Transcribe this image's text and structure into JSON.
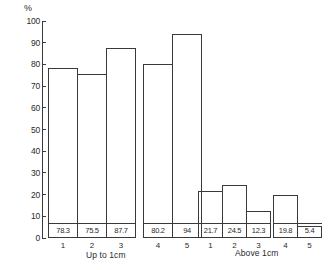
{
  "chart_data": {
    "type": "bar",
    "title": "",
    "subtitle": "",
    "xlabel": "",
    "ylabel": "%",
    "ylim": [
      0,
      100
    ],
    "ytick_step": 10,
    "ytick_labels": [
      "0",
      "10",
      "20",
      "30",
      "40",
      "50",
      "60",
      "70",
      "80",
      "90",
      "100"
    ],
    "grid": false,
    "legend": null,
    "bar_style": "outlined",
    "value_labels_inside_bars": true,
    "groups": [
      {
        "caption": "Up to 1cm",
        "clusters": [
          {
            "categories": [
              "1",
              "2",
              "3"
            ],
            "values": [
              78.3,
              75.5,
              87.7
            ],
            "value_labels": [
              "78.3",
              "75.5",
              "87.7"
            ]
          },
          {
            "categories": [
              "4",
              "5"
            ],
            "values": [
              80.2,
              94
            ],
            "value_labels": [
              "80.2",
              "94"
            ]
          }
        ]
      },
      {
        "caption": "Above 1cm",
        "clusters": [
          {
            "categories": [
              "1",
              "2",
              "3"
            ],
            "values": [
              21.7,
              24.5,
              12.3
            ],
            "value_labels": [
              "21.7",
              "24.5",
              "12.3"
            ]
          },
          {
            "categories": [
              "4",
              "5"
            ],
            "values": [
              19.8,
              5.4
            ],
            "value_labels": [
              "19.8",
              "5.4"
            ]
          }
        ]
      }
    ],
    "colors": {
      "ink": "#3a3a3a",
      "text": "#2a2a2a",
      "background": "#ffffff"
    }
  }
}
